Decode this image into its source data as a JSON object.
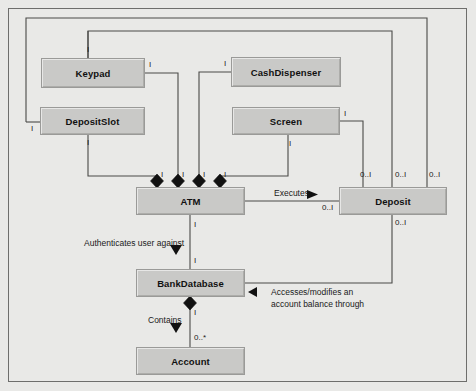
{
  "diagram": {
    "type": "uml-class-diagram",
    "border_color": "#6e6e6c",
    "background": "#e9e9e7",
    "box_fill": "#c9c9c7",
    "line_color": "#4a4a48"
  },
  "classes": [
    {
      "id": "keypad",
      "name": "Keypad",
      "x": 41,
      "y": 58,
      "w": 104,
      "h": 30
    },
    {
      "id": "cashdispenser",
      "name": "CashDispenser",
      "x": 231,
      "y": 57,
      "w": 110,
      "h": 30
    },
    {
      "id": "depositslot",
      "name": "DepositSlot",
      "x": 40,
      "y": 107,
      "w": 105,
      "h": 28
    },
    {
      "id": "screen",
      "name": "Screen",
      "x": 232,
      "y": 107,
      "w": 108,
      "h": 28
    },
    {
      "id": "atm",
      "name": "ATM",
      "x": 136,
      "y": 187,
      "w": 109,
      "h": 28
    },
    {
      "id": "deposit",
      "name": "Deposit",
      "x": 339,
      "y": 187,
      "w": 108,
      "h": 28
    },
    {
      "id": "bankdatabase",
      "name": "BankDatabase",
      "x": 136,
      "y": 269,
      "w": 109,
      "h": 28
    },
    {
      "id": "account",
      "name": "Account",
      "x": 136,
      "y": 347,
      "w": 109,
      "h": 28
    }
  ],
  "association_labels": [
    {
      "id": "authenticates",
      "text": "Authenticates user against",
      "x": 84,
      "y": 238
    },
    {
      "id": "executes",
      "text": "Executes",
      "x": 274,
      "y": 188
    },
    {
      "id": "accesses1",
      "text": "Accesses/modifies an",
      "x": 271,
      "y": 287
    },
    {
      "id": "accesses2",
      "text": "account balance through",
      "x": 271,
      "y": 299
    },
    {
      "id": "contains",
      "text": "Contains",
      "x": 148,
      "y": 315
    }
  ],
  "multiplicities": [
    {
      "id": "m-keypad-top",
      "text": "I",
      "x": 87,
      "y": 45
    },
    {
      "id": "m-keypad-right",
      "text": "I",
      "x": 149,
      "y": 60
    },
    {
      "id": "m-cashdisp-left",
      "text": "I",
      "x": 224,
      "y": 59
    },
    {
      "id": "m-depositslot-left",
      "text": "I",
      "x": 31,
      "y": 124
    },
    {
      "id": "m-depositslot-bot",
      "text": "I",
      "x": 87,
      "y": 138
    },
    {
      "id": "m-screen-right",
      "text": "I",
      "x": 344,
      "y": 109
    },
    {
      "id": "m-screen-bot",
      "text": "I",
      "x": 289,
      "y": 139
    },
    {
      "id": "m-atm-d1",
      "text": "I",
      "x": 161,
      "y": 170
    },
    {
      "id": "m-atm-d2",
      "text": "I",
      "x": 182,
      "y": 170
    },
    {
      "id": "m-atm-d3",
      "text": "I",
      "x": 203,
      "y": 170
    },
    {
      "id": "m-atm-d4",
      "text": "I",
      "x": 224,
      "y": 170
    },
    {
      "id": "m-dep-top1",
      "text": "0..I",
      "x": 360,
      "y": 170
    },
    {
      "id": "m-dep-top2",
      "text": "0..I",
      "x": 395,
      "y": 170
    },
    {
      "id": "m-dep-top3",
      "text": "0..I",
      "x": 429,
      "y": 170
    },
    {
      "id": "m-dep-left",
      "text": "0..I",
      "x": 322,
      "y": 203
    },
    {
      "id": "m-dep-bot",
      "text": "0..I",
      "x": 395,
      "y": 218
    },
    {
      "id": "m-atm-bot",
      "text": "I",
      "x": 194,
      "y": 220
    },
    {
      "id": "m-bankdb-top",
      "text": "I",
      "x": 194,
      "y": 256
    },
    {
      "id": "m-bankdb-bot",
      "text": "I",
      "x": 194,
      "y": 308
    },
    {
      "id": "m-account-top",
      "text": "0..*",
      "x": 194,
      "y": 333
    }
  ],
  "relationship_kinds": {
    "composition": "filled-diamond",
    "association": "solid-line",
    "navigable": "solid-arrowhead"
  }
}
